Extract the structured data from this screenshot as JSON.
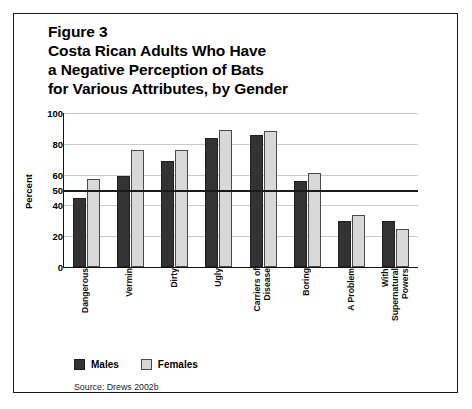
{
  "figure": {
    "title_lines": [
      "Figure 3",
      "Costa Rican Adults Who Have",
      "a Negative Perception of Bats",
      "for Various Attributes, by Gender"
    ],
    "source": "Source: Drews 2002b"
  },
  "chart_data": {
    "type": "bar",
    "title": "Costa Rican Adults Who Have a Negative Perception of Bats for Various Attributes, by Gender",
    "figure_number": "Figure 3",
    "xlabel": "",
    "ylabel": "Percent",
    "ylim": [
      0,
      100
    ],
    "yticks": [
      0,
      20,
      40,
      50,
      60,
      80,
      100
    ],
    "ytick_labels": [
      "0",
      "20",
      "40",
      "50",
      "60",
      "80",
      "100"
    ],
    "grid": true,
    "reference_line": 50,
    "legend_position": "bottom-left",
    "categories": [
      "Dangerous",
      "Vermin",
      "Dirty",
      "Ugly",
      "Carriers of\nDisease",
      "Boring",
      "A Problem",
      "With\nSupernatural\nPowers"
    ],
    "series": [
      {
        "name": "Males",
        "color": "#333333",
        "values": [
          45,
          59,
          69,
          84,
          86,
          56,
          30,
          30
        ]
      },
      {
        "name": "Females",
        "color": "#d8d8d8",
        "values": [
          57,
          76,
          76,
          89,
          88,
          61,
          34,
          25
        ]
      }
    ]
  }
}
